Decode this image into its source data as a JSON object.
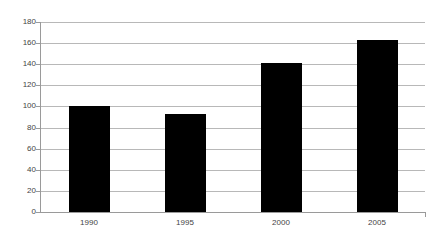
{
  "chart_data": {
    "type": "bar",
    "title": "",
    "subtitle": "",
    "xlabel": "",
    "ylabel": "",
    "categories": [
      "1990",
      "1995",
      "2000",
      "2005"
    ],
    "values": [
      100,
      93,
      141,
      163
    ],
    "series": [
      {
        "name": "Series 1",
        "values": [
          100,
          93,
          141,
          163
        ]
      }
    ],
    "ylim": [
      0,
      180
    ],
    "ytick_step": 20,
    "yticks": [
      0,
      20,
      40,
      60,
      80,
      100,
      120,
      140,
      160,
      180
    ],
    "ytick_labels": [
      "0",
      "20",
      "40",
      "60",
      "80",
      "100",
      "120",
      "140",
      "160",
      "180"
    ],
    "grid": true,
    "grid_axis": "y",
    "legend": false,
    "legend_position": "none",
    "annotations": [],
    "colors": {
      "bar": "#000000",
      "gridline": "#b8b8b8",
      "axis": "#9a9a9a",
      "tick_label": "#444444",
      "background": "#ffffff"
    }
  }
}
